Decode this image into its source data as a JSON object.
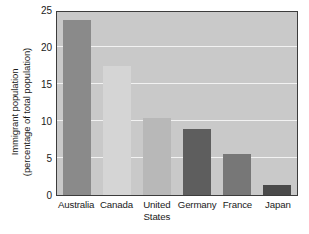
{
  "chart_data": {
    "type": "bar",
    "title": "",
    "xlabel": "",
    "ylabel": "Immigrant population\n(percentage of total population)",
    "categories": [
      "Australia",
      "Canada",
      "United\nStates",
      "Germany",
      "France",
      "Japan"
    ],
    "values": [
      23.6,
      17.4,
      10.4,
      8.9,
      5.6,
      1.4
    ],
    "ylim": [
      0,
      25
    ],
    "yticks": [
      0,
      5,
      10,
      15,
      20,
      25
    ],
    "ytick_labels": [
      "0",
      "5",
      "10",
      "15",
      "20",
      "25"
    ],
    "grid": true,
    "grid_axis": "y",
    "legend": false,
    "plot_background": "#c9c9c9",
    "gridline_color": "#f2f2f2",
    "frame_color": "#3c3c3c",
    "bar_colors": [
      "#8a8a8a",
      "#d5d5d5",
      "#b8b8b8",
      "#5e5e5e",
      "#777777",
      "#4a4a4a"
    ],
    "bars": [
      {
        "label": "Australia",
        "value": 23.6,
        "color": "#8a8a8a"
      },
      {
        "label": "Canada",
        "value": 17.4,
        "color": "#d5d5d5"
      },
      {
        "label": "United\nStates",
        "value": 10.4,
        "color": "#b8b8b8"
      },
      {
        "label": "Germany",
        "value": 8.9,
        "color": "#5e5e5e"
      },
      {
        "label": "France",
        "value": 5.6,
        "color": "#777777"
      },
      {
        "label": "Japan",
        "value": 1.4,
        "color": "#4a4a4a"
      }
    ]
  }
}
